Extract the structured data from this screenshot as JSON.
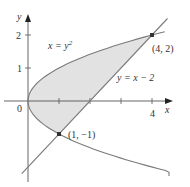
{
  "figure": {
    "colors": {
      "curve": "#7a7a7a",
      "axis": "#555555",
      "region_fill": "#e2e2e2",
      "point": "#333333",
      "text": "#333333"
    },
    "axes": {
      "x_label": "x",
      "y_label": "y",
      "origin_label": "0",
      "x_ticks": [
        {
          "value": 1,
          "label": ""
        },
        {
          "value": 2,
          "label": ""
        },
        {
          "value": 3,
          "label": ""
        },
        {
          "value": 4,
          "label": "4"
        }
      ],
      "y_ticks": [
        {
          "value": 1,
          "label": "1"
        },
        {
          "value": 2,
          "label": "2"
        }
      ]
    },
    "curves": [
      {
        "name": "parabola",
        "equation": "x = y^2",
        "label": "x = y",
        "label_sup": "2"
      },
      {
        "name": "line",
        "equation": "y = x - 2",
        "label": "y = x − 2"
      }
    ],
    "points": [
      {
        "x": 4,
        "y": 2,
        "label": "(4, 2)"
      },
      {
        "x": 1,
        "y": -1,
        "label": "(1, −1)"
      }
    ],
    "shaded_region": "between x = y^2 and y = x - 2 for -1 <= y <= 2"
  }
}
